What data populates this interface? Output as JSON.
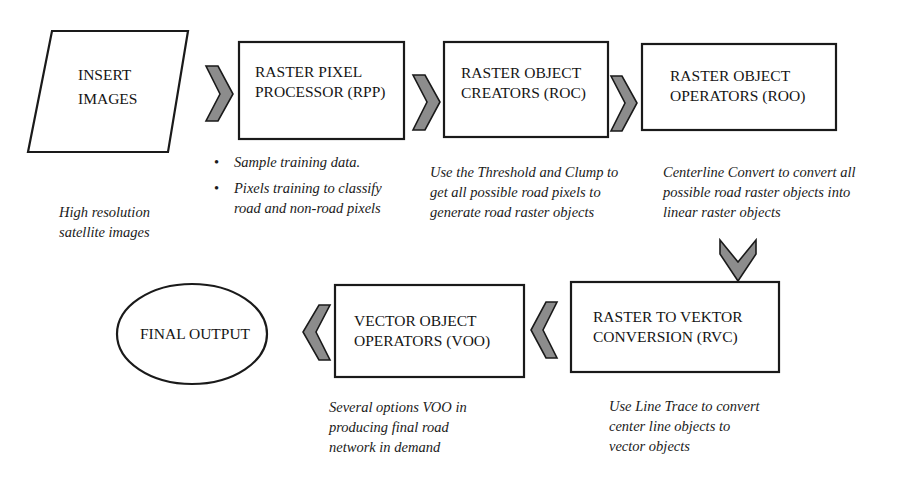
{
  "colors": {
    "stroke": "#1a1a1a",
    "arrow_fill": "#8c8c8c",
    "background": "#ffffff"
  },
  "nodes": {
    "insert_images": {
      "shape": "parallelogram",
      "label_line1": "INSERT",
      "label_line2": "IMAGES"
    },
    "rpp": {
      "shape": "rectangle",
      "label_line1": "RASTER PIXEL",
      "label_line2": "PROCESSOR (RPP)"
    },
    "roc": {
      "shape": "rectangle",
      "label_line1": "RASTER OBJECT",
      "label_line2": "CREATORS (ROC)"
    },
    "roo": {
      "shape": "rectangle",
      "label_line1": "RASTER OBJECT",
      "label_line2": "OPERATORS (ROO)"
    },
    "rvc": {
      "shape": "rectangle",
      "label_line1": "RASTER TO VEKTOR",
      "label_line2": "CONVERSION (RVC)"
    },
    "voo": {
      "shape": "rectangle",
      "label_line1": "VECTOR OBJECT",
      "label_line2": "OPERATORS (VOO)"
    },
    "final_output": {
      "shape": "ellipse",
      "label": "FINAL OUTPUT"
    }
  },
  "captions": {
    "insert_images": {
      "line1": "High resolution",
      "line2": "satellite images"
    },
    "rpp": {
      "bullets": [
        "Sample training data.",
        "Pixels training to classify road and non-road pixels"
      ]
    },
    "roc": {
      "line1": "Use the Threshold and Clump to",
      "line2": "get all possible road pixels to",
      "line3": "generate road raster objects"
    },
    "roo": {
      "line1": "Centerline Convert to convert all",
      "line2": "possible road raster objects into",
      "line3": "linear raster objects"
    },
    "rvc": {
      "line1": "Use Line Trace to convert",
      "line2": "center line objects to",
      "line3": "vector objects"
    },
    "voo": {
      "line1": "Several options VOO in",
      "line2": "producing final road",
      "line3": "network in demand"
    }
  },
  "arrows": [
    {
      "from": "insert_images",
      "to": "rpp",
      "direction": "right"
    },
    {
      "from": "rpp",
      "to": "roc",
      "direction": "right"
    },
    {
      "from": "roc",
      "to": "roo",
      "direction": "right"
    },
    {
      "from": "roo",
      "to": "rvc",
      "direction": "down"
    },
    {
      "from": "rvc",
      "to": "voo",
      "direction": "left"
    },
    {
      "from": "voo",
      "to": "final_output",
      "direction": "left"
    }
  ]
}
